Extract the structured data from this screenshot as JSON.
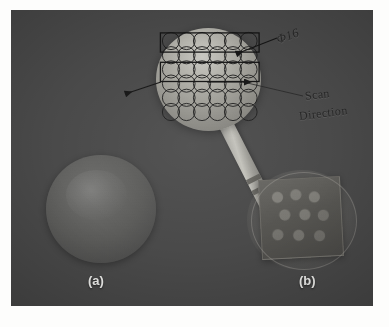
{
  "figure": {
    "type": "photograph",
    "panels": [
      {
        "id": "a",
        "caption": "(a)",
        "description": "plain-sphere-specimen"
      },
      {
        "id": "b",
        "caption": "(b)",
        "description": "probe-on-textured-fixture"
      }
    ]
  },
  "annotations": {
    "diameter_label": "Φ16",
    "scan_line_1": "Scan",
    "scan_line_2": "Direction"
  },
  "scan_grid": {
    "columns": 6,
    "rows": 6,
    "band_count": 2,
    "circle_stroke": "#1b1b1b",
    "band_stroke": "#141414"
  },
  "colors": {
    "photo_background": "#4a4a4a",
    "page_background": "#fdfdfc",
    "annotation_text": "#272727",
    "caption_text": "#f2f2f0",
    "sphere_top_highlight": "#c9c8c2",
    "probe_metal": "#c3c2bb"
  }
}
